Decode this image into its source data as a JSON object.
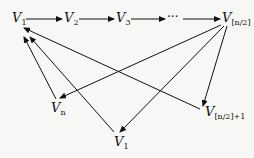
{
  "diagram": {
    "type": "directed-graph",
    "nodes": [
      {
        "id": "v1_top",
        "base": "V",
        "sub": "1"
      },
      {
        "id": "v2",
        "base": "V",
        "sub": "2"
      },
      {
        "id": "v3",
        "base": "V",
        "sub": "3"
      },
      {
        "id": "ellipsis",
        "text": "···"
      },
      {
        "id": "v_half",
        "base": "V",
        "sub": "[n/2]"
      },
      {
        "id": "v_half_plus1",
        "base": "V",
        "sub": "[n/2]+1"
      },
      {
        "id": "v_n",
        "base": "V",
        "sub": "n"
      },
      {
        "id": "v1_bottom",
        "base": "V",
        "sub": "1"
      }
    ],
    "edges": [
      {
        "from": "v1_top",
        "to": "v2"
      },
      {
        "from": "v2",
        "to": "v3"
      },
      {
        "from": "v3",
        "to": "ellipsis"
      },
      {
        "from": "ellipsis",
        "to": "v_half"
      },
      {
        "from": "v_half",
        "to": "v_n"
      },
      {
        "from": "v_half",
        "to": "v1_bottom"
      },
      {
        "from": "v_half",
        "to": "v_half_plus1"
      },
      {
        "from": "v_half_plus1",
        "to": "v1_top"
      },
      {
        "from": "v_n",
        "to": "v1_top"
      },
      {
        "from": "v1_bottom",
        "to": "v1_top"
      }
    ],
    "line_color": "#111111"
  }
}
